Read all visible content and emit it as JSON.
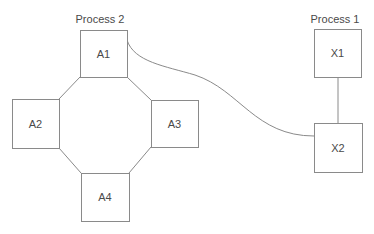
{
  "diagram": {
    "width": 374,
    "height": 234,
    "stroke_color": "#8a8a8a",
    "text_color": "#4a4a4a",
    "groups": [
      {
        "id": "process2",
        "label": "Process 2",
        "x": 100,
        "y": 23
      },
      {
        "id": "process1",
        "label": "Process 1",
        "x": 335,
        "y": 23
      }
    ],
    "nodes": [
      {
        "id": "A1",
        "label": "A1",
        "x": 80,
        "y": 30,
        "w": 47,
        "h": 47
      },
      {
        "id": "A2",
        "label": "A2",
        "x": 12,
        "y": 99,
        "w": 47,
        "h": 49
      },
      {
        "id": "A3",
        "label": "A3",
        "x": 151,
        "y": 100,
        "w": 47,
        "h": 47
      },
      {
        "id": "A4",
        "label": "A4",
        "x": 81,
        "y": 173,
        "w": 48,
        "h": 48
      },
      {
        "id": "X1",
        "label": "X1",
        "x": 314,
        "y": 29,
        "w": 47,
        "h": 48
      },
      {
        "id": "X2",
        "label": "X2",
        "x": 314,
        "y": 123,
        "w": 48,
        "h": 49
      }
    ],
    "edges": [
      {
        "id": "A1-A2",
        "from": "A1",
        "to": "A2",
        "path": "M80,77 L59,99"
      },
      {
        "id": "A1-A3",
        "from": "A1",
        "to": "A3",
        "path": "M127,77 L151,100"
      },
      {
        "id": "A2-A4",
        "from": "A2",
        "to": "A4",
        "path": "M59,148 L81,173"
      },
      {
        "id": "A3-A4",
        "from": "A3",
        "to": "A4",
        "path": "M151,147 L129,173"
      },
      {
        "id": "X1-X2",
        "from": "X1",
        "to": "X2",
        "path": "M338,77 L338,123"
      },
      {
        "id": "A1-X2",
        "from": "A1",
        "to": "X2",
        "path": "M127,40 C134,62 165,66 195,75 C240,90 255,136 314,136"
      }
    ]
  }
}
